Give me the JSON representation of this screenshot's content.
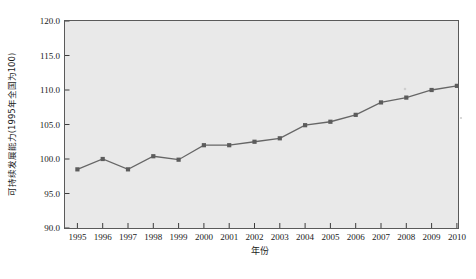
{
  "chart_data": {
    "type": "line",
    "title": "",
    "xlabel": "年份",
    "ylabel": "可持续发展能力(1995年全国为100)",
    "categories": [
      "1995",
      "1996",
      "1997",
      "1998",
      "1999",
      "2000",
      "2001",
      "2002",
      "2003",
      "2004",
      "2005",
      "2006",
      "2007",
      "2008",
      "2009",
      "2010"
    ],
    "values": [
      98.5,
      100.0,
      98.5,
      100.4,
      99.9,
      102.0,
      102.0,
      102.5,
      103.0,
      104.9,
      105.4,
      106.4,
      108.2,
      108.9,
      110.0,
      110.6
    ],
    "series": [
      {
        "name": "可持续发展能力",
        "values": [
          98.5,
          100.0,
          98.5,
          100.4,
          99.9,
          102.0,
          102.0,
          102.5,
          103.0,
          104.9,
          105.4,
          106.4,
          108.2,
          108.9,
          110.0,
          110.6
        ]
      }
    ],
    "ylim": [
      90.0,
      120.0
    ],
    "yticks": [
      90.0,
      95.0,
      100.0,
      105.0,
      110.0,
      115.0,
      120.0
    ],
    "ytick_labels": [
      "90.0",
      "95.0",
      "100.0",
      "105.0",
      "110.0",
      "115.0",
      "120.0"
    ],
    "xlim": [
      "1995",
      "2010"
    ],
    "grid": false,
    "legend": "none",
    "marker": "square",
    "line_color": "#666666",
    "marker_color": "#5c5c5c",
    "plot_background": "#e9e9e9",
    "figure_background": "#ffffff"
  },
  "caption": {
    "text": ""
  }
}
